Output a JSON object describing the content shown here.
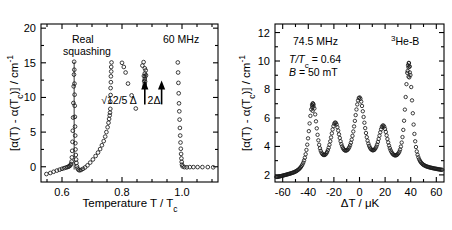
{
  "figure": {
    "title": "",
    "panels": [
      "left",
      "right"
    ]
  },
  "left_panel": {
    "annotations": {
      "real": "Real",
      "squashing": "squashing",
      "freq": "60 MHz",
      "arrow1_label": "√12/5 Δ",
      "arrow2_label": "2Δ"
    },
    "xlabel": "Temperature T / T",
    "xlabel_sub": "c",
    "ylabel_pre": "[α(T) - α(T",
    "ylabel_sub": "c",
    "ylabel_post": ")] / cm",
    "ylabel_exp": "-1",
    "xticks": [
      "0.6",
      "0.8",
      "1.0"
    ],
    "yticks": [
      "0",
      "5",
      "10",
      "15",
      "20"
    ]
  },
  "right_panel": {
    "annotations": {
      "freq": "74.5 MHz",
      "sample_sup": "3",
      "sample": "He-B",
      "temp_pre": "T/T",
      "temp_sub": "c",
      "temp_post": " = 0.64",
      "field_pre": "B",
      "field_post": " = 50 mT"
    },
    "xlabel": "ΔT / μK",
    "ylabel_pre": "[α(T) - α(T",
    "ylabel_sub": "c",
    "ylabel_post": ")] / cm",
    "ylabel_exp": "-1",
    "xticks": [
      "-60",
      "-40",
      "-20",
      "0",
      "20",
      "40",
      "60"
    ],
    "yticks": [
      "2",
      "4",
      "6",
      "8",
      "10",
      "12"
    ]
  },
  "chart_data": [
    {
      "type": "scatter",
      "panel": "left",
      "title": "Real squashing mode attenuation vs reduced temperature",
      "xlabel": "Temperature T / Tc",
      "ylabel": "[alpha(T) - alpha(Tc)] / cm^-1",
      "xlim": [
        0.53,
        1.12
      ],
      "ylim": [
        -2.2,
        20.6
      ],
      "xticks": [
        0.6,
        0.8,
        1.0
      ],
      "yticks": [
        0,
        5,
        10,
        15,
        20
      ],
      "grid": false,
      "legend": null,
      "annotations": [
        {
          "text": "Real",
          "x": 0.655,
          "y": 18.6
        },
        {
          "text": "squashing",
          "x": 0.655,
          "y": 17.1
        },
        {
          "text": "60 MHz",
          "x": 1.01,
          "y": 18.6
        },
        {
          "text": "√12/5 Δ",
          "x": 0.876,
          "y": 8.4,
          "arrow_to_y": 12.3
        },
        {
          "text": "2Δ",
          "x": 0.932,
          "y": 8.4,
          "arrow_to_y": 12.3
        }
      ],
      "series": [
        {
          "name": "low-temperature branch",
          "x": [
            0.548,
            0.561,
            0.572,
            0.583,
            0.592,
            0.6,
            0.607,
            0.613,
            0.618,
            0.622,
            0.625,
            0.628,
            0.63,
            0.632,
            0.633,
            0.634,
            0.635,
            0.636,
            0.637,
            0.638,
            0.639,
            0.64
          ],
          "y": [
            -1.05,
            -0.9,
            -0.72,
            -0.55,
            -0.42,
            -0.3,
            -0.2,
            -0.12,
            -0.05,
            0.02,
            0.1,
            0.22,
            0.4,
            0.75,
            1.35,
            2.3,
            3.6,
            5.2,
            7.1,
            9.2,
            11.6,
            13.3
          ]
        },
        {
          "name": "peak apex",
          "x": [
            0.6405,
            0.641
          ],
          "y": [
            15.15,
            14.0
          ]
        },
        {
          "name": "high-temperature descending branch",
          "x": [
            0.6415,
            0.642,
            0.6425,
            0.643,
            0.6435,
            0.644,
            0.6445,
            0.645,
            0.646,
            0.647,
            0.648,
            0.65,
            0.652,
            0.655,
            0.659,
            0.664,
            0.67,
            0.677,
            0.685,
            0.694,
            0.703,
            0.712,
            0.72,
            0.727
          ],
          "y": [
            12.0,
            10.4,
            8.8,
            7.2,
            5.8,
            4.5,
            3.4,
            2.5,
            1.7,
            1.05,
            0.55,
            0.05,
            -0.25,
            -0.45,
            -0.52,
            -0.45,
            -0.3,
            -0.1,
            0.2,
            0.6,
            1.05,
            1.55,
            2.05,
            2.55
          ]
        },
        {
          "name": "rising tail to second branch",
          "x": [
            0.733,
            0.739,
            0.744,
            0.748,
            0.752,
            0.755,
            0.757,
            0.759,
            0.76
          ],
          "y": [
            3.1,
            3.7,
            4.35,
            5.0,
            5.7,
            6.35,
            6.9,
            7.4,
            7.8
          ]
        },
        {
          "name": "vertical column at 0.76",
          "x": [
            0.761,
            0.761,
            0.762,
            0.762,
            0.763,
            0.763,
            0.764,
            0.764,
            0.765
          ],
          "y": [
            8.35,
            9.4,
            10.35,
            11.35,
            12.2,
            13.05,
            13.75,
            14.4,
            15.05
          ]
        },
        {
          "name": "pair-breaking cluster near sqrt(12/5) Delta",
          "x": [
            0.868,
            0.872,
            0.876,
            0.879,
            0.876,
            0.873,
            0.877,
            0.88,
            0.876,
            0.874,
            0.877,
            0.876,
            0.875
          ],
          "y": [
            14.6,
            15.1,
            14.2,
            13.9,
            13.45,
            13.1,
            13.0,
            13.2,
            12.65,
            12.35,
            12.3,
            11.95,
            11.6
          ]
        },
        {
          "name": "sparse points left of cluster",
          "x": [
            0.8,
            0.806,
            0.812,
            0.82,
            0.832,
            0.846
          ],
          "y": [
            15.0,
            14.4,
            13.6,
            12.0,
            10.3,
            8.4
          ]
        },
        {
          "name": "descending column near 2 Delta / Tc",
          "x": [
            0.986,
            0.987,
            0.988,
            0.989,
            0.99,
            0.991,
            0.992,
            0.993,
            0.994,
            0.995,
            0.996,
            0.997,
            0.998,
            0.999,
            1.0
          ],
          "y": [
            15.05,
            13.6,
            12.1,
            10.6,
            9.15,
            8.0,
            6.8,
            5.6,
            4.5,
            3.5,
            2.6,
            1.85,
            1.2,
            0.7,
            0.3
          ]
        },
        {
          "name": "flat tail above Tc",
          "x": [
            1.002,
            1.008,
            1.016,
            1.026,
            1.038,
            1.052,
            1.068,
            1.086,
            1.104
          ],
          "y": [
            0.05,
            -0.05,
            -0.08,
            -0.05,
            -0.05,
            -0.05,
            -0.05,
            -0.05,
            -0.08
          ]
        }
      ]
    },
    {
      "type": "scatter",
      "panel": "right",
      "title": "Zeeman-split squashing mode resonances in 3He-B at 74.5 MHz",
      "xlabel": "ΔT / μK",
      "ylabel": "[alpha(T) - alpha(Tc)] / cm^-1",
      "xlim": [
        -66,
        66
      ],
      "ylim": [
        1.5,
        12.6
      ],
      "xticks": [
        -60,
        -40,
        -20,
        0,
        20,
        40,
        60
      ],
      "yticks": [
        2,
        4,
        6,
        8,
        10,
        12
      ],
      "grid": false,
      "legend": null,
      "annotations": [
        {
          "text": "74.5 MHz",
          "x": -45,
          "y": 11.15
        },
        {
          "text": "3He-B",
          "x": 35,
          "y": 11.3
        },
        {
          "text": "T/Tc = 0.64",
          "x": -47,
          "y": 9.95
        },
        {
          "text": "B = 50 mT",
          "x": -47,
          "y": 9.15
        }
      ],
      "peaks": [
        {
          "center": -36.5,
          "height": 7.0,
          "width": 4.0
        },
        {
          "center": -19.0,
          "height": 5.6,
          "width": 4.5
        },
        {
          "center": 0.0,
          "height": 7.4,
          "width": 5.0
        },
        {
          "center": 18.5,
          "height": 5.4,
          "width": 4.5
        },
        {
          "center": 38.5,
          "height": 9.85,
          "width": 3.6
        }
      ],
      "baseline": {
        "x": [
          -64,
          -50,
          -30,
          -10,
          10,
          30,
          50,
          64
        ],
        "y": [
          1.85,
          2.15,
          2.75,
          3.05,
          3.05,
          2.95,
          2.55,
          2.35
        ]
      }
    }
  ]
}
